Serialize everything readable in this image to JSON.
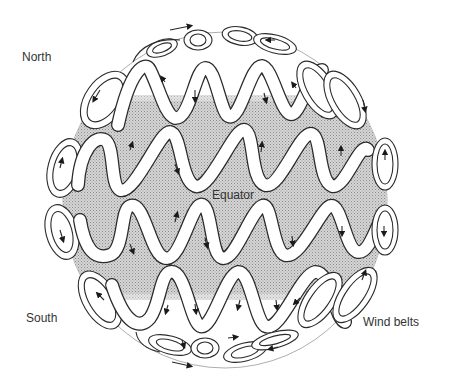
{
  "figure": {
    "title": "Wind belts",
    "labels": {
      "north": "North",
      "south": "South",
      "equator": "Equator",
      "wind_belts": "Wind belts"
    },
    "colors": {
      "background": "#ffffff",
      "sphere_shading": "#c8c8c8",
      "ribbon_fill": "#ffffff",
      "outline": "#2a2a2a",
      "text": "#333333"
    },
    "sphere": {
      "cx": 225,
      "cy": 200,
      "rx": 162,
      "ry": 168
    },
    "shaded_band": {
      "top_y": 95,
      "bottom_y": 300
    },
    "belts": [
      {
        "name": "north-polar-loops",
        "y": 35,
        "coils": 4,
        "flow": "east"
      },
      {
        "name": "north-temperate-belt",
        "y": 95,
        "coils": 6,
        "flow": "west"
      },
      {
        "name": "north-tropical-belt",
        "y": 160,
        "coils": 7,
        "flow": "mixed"
      },
      {
        "name": "south-tropical-belt",
        "y": 230,
        "coils": 7,
        "flow": "mixed"
      },
      {
        "name": "south-temperate-belt",
        "y": 300,
        "coils": 6,
        "flow": "west"
      },
      {
        "name": "south-polar-loops",
        "y": 355,
        "coils": 4,
        "flow": "east"
      }
    ]
  }
}
